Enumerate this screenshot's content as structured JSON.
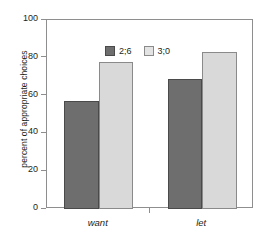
{
  "chart_data": {
    "type": "bar",
    "title": "",
    "subtitle": "",
    "xlabel": "",
    "ylabel": "percent of appropriate choices",
    "categories": [
      "want",
      "let"
    ],
    "series": [
      {
        "name": "2;6",
        "color": "#6e6e6e",
        "values": [
          57,
          69
        ]
      },
      {
        "name": "3;0",
        "color": "#d9d9d9",
        "values": [
          78,
          83
        ]
      }
    ],
    "ylim": [
      0,
      100
    ],
    "ytick_labels": [
      "0",
      "20",
      "40",
      "60",
      "80",
      "100"
    ],
    "ytick_values": [
      0,
      20,
      40,
      60,
      80,
      100
    ],
    "grid": false,
    "legend_position": "top-left-inside",
    "frame": true,
    "category_label_style": "italic",
    "annotations": []
  },
  "legend": {
    "entries": [
      {
        "label": "2;6"
      },
      {
        "label": "3;0"
      }
    ]
  }
}
